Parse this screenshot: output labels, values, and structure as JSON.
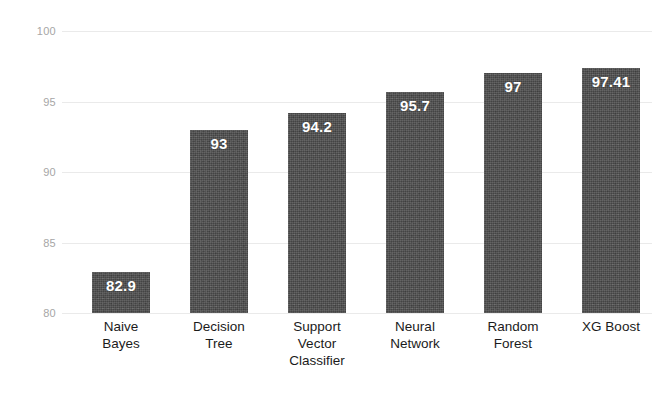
{
  "chart_data": {
    "type": "bar",
    "title": "",
    "subtitle": "",
    "xlabel": "",
    "ylabel": "",
    "ylim": [
      80,
      100
    ],
    "yticks": [
      80,
      85,
      90,
      95,
      100
    ],
    "ytick_labels": [
      "80",
      "85",
      "90",
      "95",
      "100"
    ],
    "grid": true,
    "legend": "none",
    "categories": [
      "Naive Bayes",
      "Decision Tree",
      "Support Vector Classifier",
      "Neural Network",
      "Random Forest",
      "XG Boost"
    ],
    "category_lines": [
      [
        "Naive",
        "Bayes"
      ],
      [
        "Decision",
        "Tree"
      ],
      [
        "Support",
        "Vector",
        "Classifier"
      ],
      [
        "Neural",
        "Network"
      ],
      [
        "Random",
        "Forest"
      ],
      [
        "XG Boost"
      ]
    ],
    "values": [
      82.9,
      93,
      94.2,
      95.7,
      97,
      97.41
    ],
    "value_labels": [
      "82.9",
      "93",
      "94.2",
      "95.7",
      "97",
      "97.41"
    ],
    "bar_color": "#4e4e4e",
    "value_label_color": "#ffffff",
    "gridline_color": "#e8e8e8",
    "ytick_color": "#a6a6a6",
    "category_label_color": "#1b1b1b",
    "background_color": "#ffffff"
  }
}
